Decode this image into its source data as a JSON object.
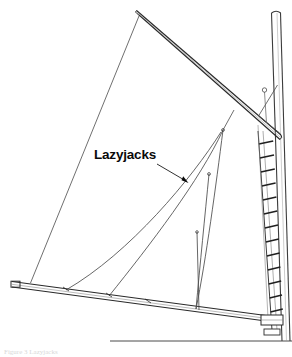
{
  "figure": {
    "background_color": "#ffffff",
    "line_color": "#3c3c3c",
    "dark_line_color": "#1a1a1a",
    "annotation_color": "#0a0a0a",
    "annotations": [
      {
        "id": "lazyjacks",
        "label": "Lazyjacks",
        "text_x": 94,
        "text_y": 159,
        "leader": {
          "x1": 155,
          "y1": 163,
          "x2": 188,
          "y2": 183
        },
        "arrow_x": 188,
        "arrow_y": 183
      }
    ],
    "caption": {
      "text": "Figure 3 Lazyjacks",
      "x": 4,
      "y": 354
    },
    "parts": {
      "gaff_label": "gaff",
      "boom_label": "boom",
      "mast_label": "mast",
      "mast_steps_label": "mast steps",
      "sail_label": "sail",
      "lazyjack_label": "lazyjack line",
      "deck_label": "deck line",
      "gooseneck_label": "gooseneck"
    },
    "geometry": {
      "mast": {
        "front_top_x": 272,
        "front_top_y": 12,
        "front_bottom_x": 283,
        "front_bottom_y": 341,
        "back_top_x": 281,
        "back_top_y": 12,
        "back_bottom_x": 290,
        "back_bottom_y": 341,
        "cap_y": 12
      },
      "gaff": {
        "tip_x": 137,
        "tip_y": 12,
        "heel_x": 281,
        "heel_y": 137,
        "thickness": 4
      },
      "boom": {
        "tip_x": 11,
        "tip_y": 283,
        "heel_x": 277,
        "heel_y": 320,
        "thickness": 4
      },
      "sail": {
        "head_x": 139,
        "head_y": 15,
        "throat_x": 262,
        "throat_y": 122,
        "tack_x": 30,
        "tack_y": 284,
        "clew_x": 268,
        "clew_y": 318
      },
      "lazyjack_apex_upper": {
        "x": 223,
        "y": 130
      },
      "lazyjack_apex_mid": {
        "x": 209,
        "y": 174
      },
      "lazyjack_apex_low": {
        "x": 197,
        "y": 232
      },
      "boom_attachments": [
        {
          "x": 66,
          "y": 290
        },
        {
          "x": 109,
          "y": 296
        },
        {
          "x": 148,
          "y": 302
        },
        {
          "x": 196,
          "y": 309
        }
      ],
      "mast_steps_count": 13,
      "deck_line": {
        "x1": 109,
        "y1": 341,
        "x2": 292,
        "y2": 341
      }
    }
  }
}
